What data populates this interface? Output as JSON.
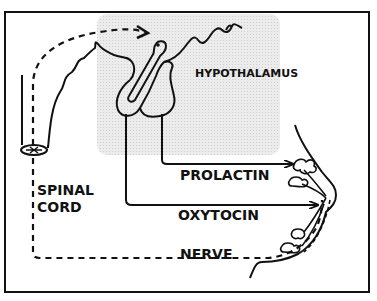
{
  "diagram": {
    "labels": {
      "hypothalamus": "HYPOTHALAMUS",
      "spinal_cord_line1": "SPINAL",
      "spinal_cord_line2": "CORD",
      "prolactin": "PROLACTIN",
      "oxytocin": "OXYTOCIN",
      "nerve": "NERVE"
    },
    "colors": {
      "line": "#111111",
      "shaded_region": "#e4e4e4",
      "background": "#ffffff"
    },
    "elements": [
      "frame-border",
      "shaded-brain-region",
      "brain-outline",
      "pituitary-gland",
      "spinal-cord",
      "nerve-dashed-path",
      "prolactin-arrow",
      "oxytocin-arrow",
      "breast-outline",
      "milk-glands"
    ]
  }
}
